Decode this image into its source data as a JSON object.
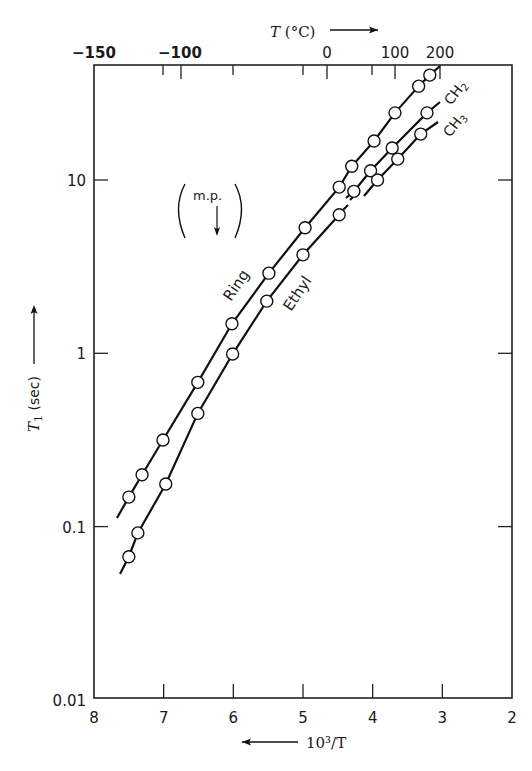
{
  "chart_data": {
    "type": "scatter",
    "title": "",
    "xlabel": "10^3/T",
    "ylabel": "T1 (sec)",
    "x_direction": "decreasing (arrow points left)",
    "y_scale": "log",
    "xlim": [
      8,
      2
    ],
    "ylim": [
      0.01,
      46
    ],
    "x_ticks": [
      "8",
      "7",
      "6",
      "5",
      "4",
      "3",
      "2"
    ],
    "x_tick_values": [
      8,
      7,
      6,
      5,
      4,
      3,
      2
    ],
    "y_ticks": [
      "0.01",
      "0.1",
      "1",
      "10"
    ],
    "y_tick_values": [
      0.01,
      0.1,
      1,
      10
    ],
    "top_axis": {
      "label": "T (°C)",
      "labeled_ticks": [
        "-150",
        "-100",
        "0",
        "100",
        "200"
      ],
      "labeled_tick_values": [
        -150,
        -100,
        0,
        100,
        200
      ]
    },
    "grid": false,
    "series": [
      {
        "name": "Ring",
        "x": [
          7.5,
          7.31,
          7.01,
          6.51,
          6.02,
          5.49,
          4.97,
          4.48,
          4.3,
          3.98,
          3.68,
          3.34,
          3.18
        ],
        "y": [
          0.148,
          0.199,
          0.316,
          0.68,
          1.48,
          2.9,
          5.3,
          9.1,
          12.0,
          16.8,
          24.4,
          34.8,
          40.3
        ]
      },
      {
        "name": "Ethyl",
        "x": [
          7.5,
          7.37,
          6.97,
          6.51,
          6.01,
          5.52,
          5.0,
          4.48
        ],
        "y": [
          0.067,
          0.092,
          0.176,
          0.45,
          0.99,
          2.0,
          3.7,
          6.3
        ]
      },
      {
        "name": "CH2",
        "x": [
          4.27,
          4.03,
          3.72,
          3.22
        ],
        "y": [
          8.6,
          11.3,
          15.3,
          24.4
        ]
      },
      {
        "name": "CH3",
        "x": [
          3.93,
          3.64,
          3.31
        ],
        "y": [
          10.0,
          13.2,
          18.4
        ]
      }
    ],
    "annotations": [
      {
        "text": "m.p.",
        "arrow": "down",
        "bracketed": true
      },
      {
        "text": "Ring"
      },
      {
        "text": "Ethyl"
      },
      {
        "text": "CH2"
      },
      {
        "text": "CH3"
      }
    ]
  },
  "labels": {
    "top_axis_title": "T (°C)",
    "bottom_axis_title": "10³/T",
    "y_axis_title_main": "T",
    "y_axis_title_sub": "1",
    "y_axis_title_unit": " (sec)",
    "mp": "m.p.",
    "ring": "Ring",
    "ethyl": "Ethyl",
    "ch2_main": "CH",
    "ch2_sub": "2",
    "ch3_main": "CH",
    "ch3_sub": "3"
  }
}
